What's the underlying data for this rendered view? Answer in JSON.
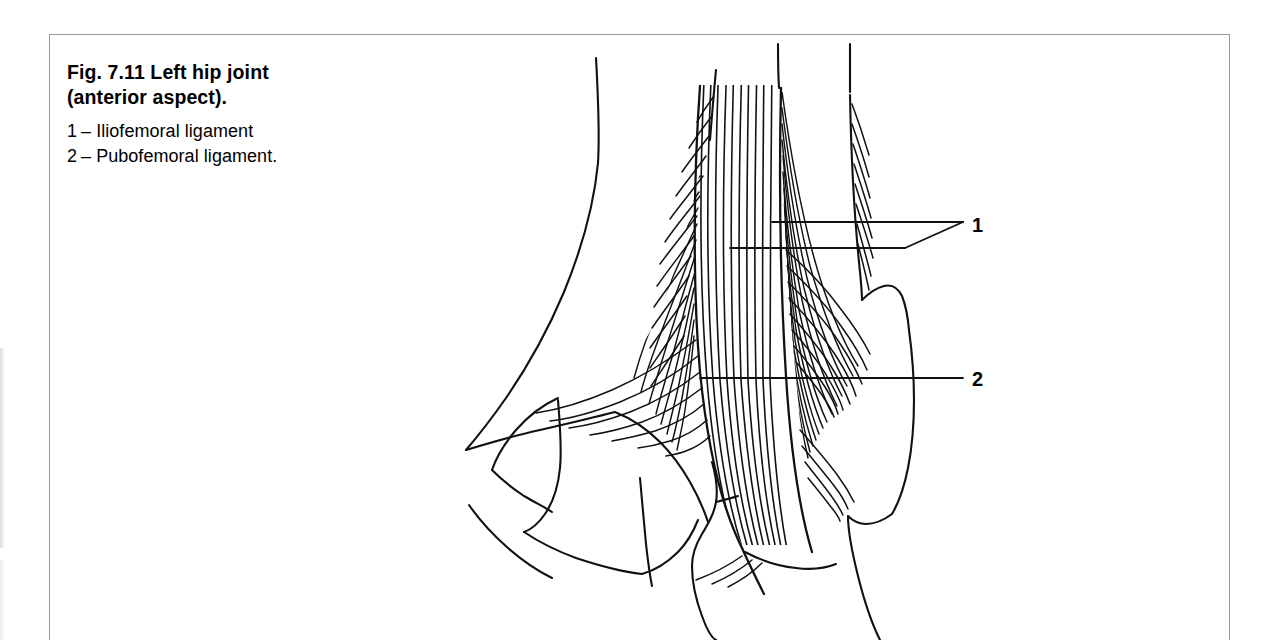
{
  "figure": {
    "caption_title": "Fig. 7.11    Left hip joint\n(anterior aspect).",
    "legend": [
      {
        "num": "1",
        "dash": "–",
        "text": "Iliofemoral ligament"
      },
      {
        "num": "2",
        "dash": "–",
        "text": "Pubofemoral ligament."
      }
    ],
    "callouts": [
      {
        "id": "1",
        "label": "1"
      },
      {
        "id": "2",
        "label": "2"
      }
    ],
    "colors": {
      "ink": "#000000",
      "frame": "#9a9a9a",
      "paper": "#ffffff"
    },
    "illustration": {
      "title": "Left hip joint, anterior aspect",
      "parts": [
        "ilium",
        "superior pubic ramus",
        "obturator foramen",
        "pubis",
        "femoral head and neck",
        "greater trochanter",
        "lesser trochanter",
        "femoral shaft",
        "iliofemoral ligament fibres",
        "pubofemoral ligament fibres"
      ]
    }
  }
}
